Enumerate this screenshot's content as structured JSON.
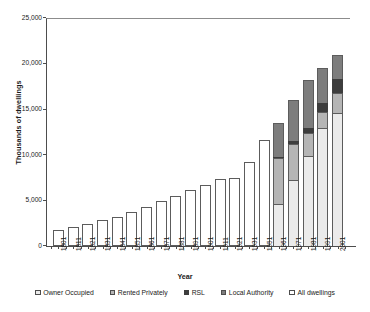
{
  "chart_data": {
    "type": "bar",
    "title": "",
    "subtitle": "",
    "xlabel": "Year",
    "ylabel": "Thousands of dwellings",
    "ylim": [
      0,
      25000
    ],
    "yticks": [
      "0",
      "5,000",
      "10,000",
      "15,000",
      "20,000",
      "25,000"
    ],
    "ytick_values": [
      0,
      5000,
      10000,
      15000,
      20000,
      25000
    ],
    "grid": false,
    "legend_position": "bottom",
    "stacked": true,
    "categories": [
      "1801",
      "1811",
      "1821",
      "1831",
      "1841",
      "1851",
      "1861",
      "1871",
      "1881",
      "1891",
      "1901",
      "1911",
      "1921",
      "1931",
      "1951",
      "1961",
      "1971",
      "1981",
      "1991",
      "2001"
    ],
    "series": [
      {
        "name": "All dwellings",
        "values": [
          1800,
          2100,
          2400,
          2800,
          3200,
          3700,
          4300,
          4900,
          5500,
          6100,
          6700,
          7300,
          7500,
          9200,
          11600,
          null,
          null,
          null,
          null,
          null
        ]
      },
      {
        "name": "Owner Occupied",
        "values": [
          null,
          null,
          null,
          null,
          null,
          null,
          null,
          null,
          null,
          null,
          null,
          null,
          null,
          null,
          null,
          4600,
          7200,
          9900,
          12900,
          14600
        ]
      },
      {
        "name": "Rented Privately",
        "values": [
          null,
          null,
          null,
          null,
          null,
          null,
          null,
          null,
          null,
          null,
          null,
          null,
          null,
          null,
          null,
          5000,
          4000,
          2500,
          1800,
          2200
        ]
      },
      {
        "name": "RSL",
        "values": [
          null,
          null,
          null,
          null,
          null,
          null,
          null,
          null,
          null,
          null,
          null,
          null,
          null,
          null,
          null,
          200,
          300,
          500,
          1000,
          1500
        ]
      },
      {
        "name": "Local Authority",
        "values": [
          null,
          null,
          null,
          null,
          null,
          null,
          null,
          null,
          null,
          null,
          null,
          null,
          null,
          null,
          null,
          3700,
          4500,
          5300,
          3800,
          2700
        ]
      }
    ],
    "totals": [
      1800,
      2100,
      2400,
      2800,
      3200,
      3700,
      4300,
      4900,
      5500,
      6100,
      6700,
      7300,
      7500,
      9200,
      11600,
      13500,
      16000,
      18200,
      19500,
      21000
    ]
  },
  "legend": {
    "items": [
      {
        "label": "Owner Occupied",
        "swatch": "sw-owner",
        "color": "#ebebeb"
      },
      {
        "label": "Rented Privately",
        "swatch": "sw-rent",
        "color": "#b5b5b5"
      },
      {
        "label": "RSL",
        "swatch": "sw-rsl",
        "color": "#3d3d3d"
      },
      {
        "label": "Local Authority",
        "swatch": "sw-la",
        "color": "#7d7d7d"
      },
      {
        "label": "All dwellings",
        "swatch": "sw-all",
        "color": "#ffffff"
      }
    ]
  }
}
